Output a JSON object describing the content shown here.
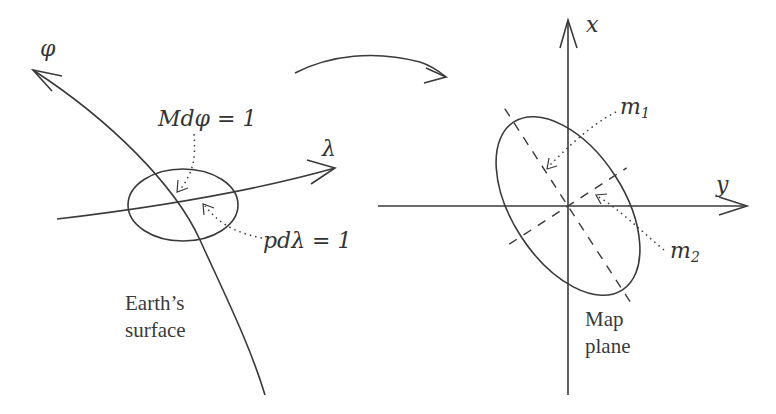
{
  "left_panel": {
    "axis_phi_label": "φ",
    "axis_lambda_label": "λ",
    "annotation_M": "Mdφ = 1",
    "annotation_p": "pdλ = 1",
    "caption_line1": "Earth’s",
    "caption_line2": "surface"
  },
  "right_panel": {
    "axis_x_label": "x",
    "axis_y_label": "y",
    "annotation_m1": "m",
    "annotation_m1_sub": "1",
    "annotation_m2": "m",
    "annotation_m2_sub": "2",
    "caption_line1": "Map",
    "caption_line2": "plane"
  },
  "colors": {
    "stroke": "#3a3a3a",
    "background": "#ffffff"
  }
}
